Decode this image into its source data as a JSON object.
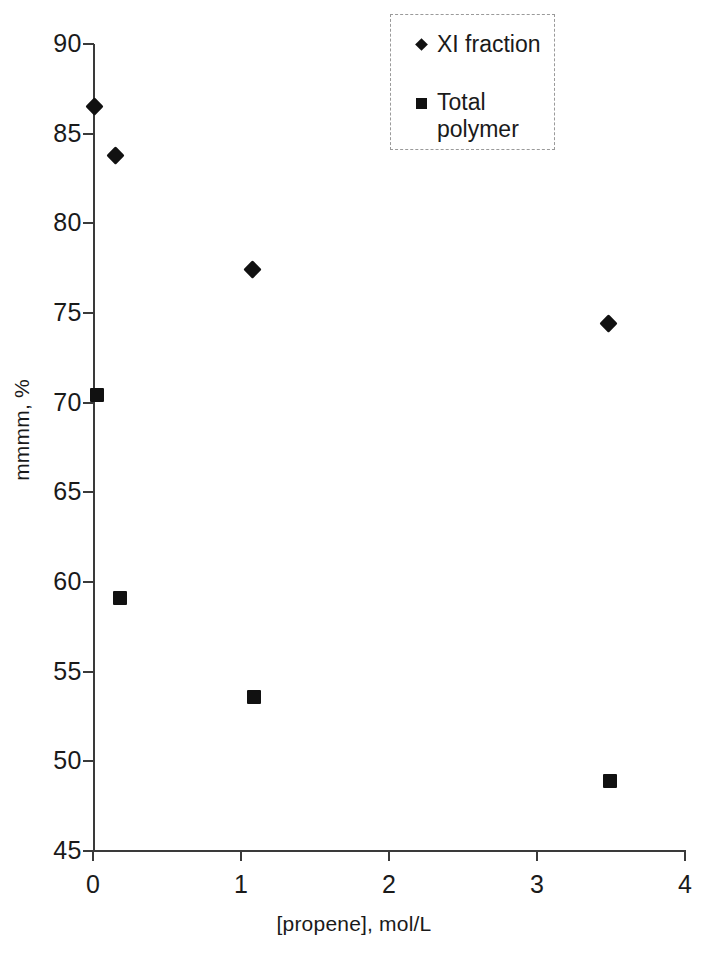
{
  "chart_data": {
    "type": "scatter",
    "title": "",
    "xlabel": "[propene], mol/L",
    "ylabel": "mmmm, %",
    "xlim": [
      0,
      4
    ],
    "ylim": [
      45,
      90
    ],
    "xticks": [
      "0",
      "1",
      "2",
      "3",
      "4"
    ],
    "yticks": [
      "45",
      "50",
      "55",
      "60",
      "65",
      "70",
      "75",
      "80",
      "85",
      "90"
    ],
    "grid": false,
    "legend_position": "top-right",
    "series": [
      {
        "name": "XI fraction",
        "marker": "diamond",
        "color": "#111111",
        "points": [
          {
            "x": 0.01,
            "y": 86.5
          },
          {
            "x": 0.15,
            "y": 83.8
          },
          {
            "x": 1.08,
            "y": 77.4
          },
          {
            "x": 3.48,
            "y": 74.4
          }
        ]
      },
      {
        "name": "Total polymer",
        "marker": "square",
        "color": "#111111",
        "points": [
          {
            "x": 0.03,
            "y": 70.4
          },
          {
            "x": 0.18,
            "y": 59.1
          },
          {
            "x": 1.09,
            "y": 53.6
          },
          {
            "x": 3.49,
            "y": 48.9
          }
        ]
      }
    ]
  },
  "legend": {
    "entries": [
      {
        "label": "XI fraction",
        "marker": "diamond"
      },
      {
        "label": "Total polymer",
        "marker": "square"
      }
    ]
  }
}
